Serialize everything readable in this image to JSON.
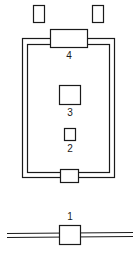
{
  "diagram": {
    "labels": {
      "component_4": "4",
      "component_3": "3",
      "component_2": "2",
      "component_1": "1"
    },
    "colors": {
      "stroke": "#1a1a1a",
      "background": "#ffffff"
    }
  }
}
